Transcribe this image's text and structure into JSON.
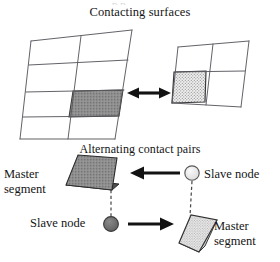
{
  "figure": {
    "background_color": "#ffffff",
    "ink_color": "#141414",
    "title_top": "Contacting surfaces",
    "title_bottom": "Alternating contact pairs",
    "partial_cropped_text_top": "p p"
  },
  "upper_panel": {
    "name": "contacting-surfaces-panel",
    "left_mesh": {
      "name": "left-surface-mesh",
      "columns": 2,
      "rows": 4,
      "highlighted_cell": {
        "row": 3,
        "column": 2,
        "fill": "solid-dark-gray",
        "color": "#8a8a8a"
      },
      "line_color": "#55555a"
    },
    "right_mesh": {
      "name": "right-surface-mesh",
      "columns": 2,
      "rows": 2,
      "highlighted_cell": {
        "row": 2,
        "column": 1,
        "fill": "stippled",
        "color": "#e3e3e3"
      },
      "line_color": "#55555a"
    },
    "connector": {
      "name": "double-headed-arrow",
      "type": "double-arrow",
      "direction": "horizontal",
      "color": "#121212"
    }
  },
  "lower_panel": {
    "name": "alternating-contact-pairs-panel",
    "pair_top": {
      "name": "contact-pair-top",
      "segment_label": "Master\nsegment",
      "segment_label_line1": "Master",
      "segment_label_line2": "segment",
      "segment_fill": "solid-dark-gray",
      "segment_color": "#6f6f6f",
      "node_label": "Slave node",
      "node_fill": "light",
      "node_color": "#e0e0e0",
      "arrow_direction": "left",
      "arrow_color": "#121212",
      "dashed_link": true
    },
    "pair_bottom": {
      "name": "contact-pair-bottom",
      "node_label": "Slave node",
      "node_fill": "dark",
      "node_color": "#6b6b6b",
      "segment_label_line1": "Master",
      "segment_label_line2": "segment",
      "segment_fill": "stippled",
      "segment_color": "#dedede",
      "arrow_direction": "right",
      "arrow_color": "#121212",
      "dashed_link": true
    }
  }
}
